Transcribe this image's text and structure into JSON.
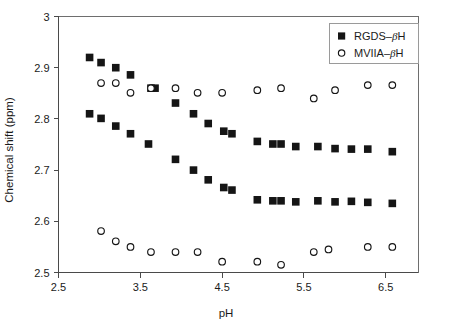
{
  "chart_data": {
    "type": "scatter",
    "title": "",
    "xlabel": "pH",
    "ylabel": "Chemical shift (ppm)",
    "xlim": [
      2.5,
      6.9
    ],
    "ylim": [
      2.5,
      3.0
    ],
    "xticks": [
      2.5,
      3.5,
      4.5,
      5.5,
      6.5
    ],
    "xtick_labels": [
      "2.5",
      "3.5",
      "4.5",
      "5.5",
      "6.5"
    ],
    "yticks": [
      2.5,
      2.6,
      2.7,
      2.8,
      2.9,
      3.0
    ],
    "ytick_labels": [
      "2.5",
      "2.6",
      "2.7",
      "2.8",
      "2.9",
      "3"
    ],
    "grid": false,
    "legend_position": "top-right",
    "legend": [
      "RGDS–βH",
      "MVIIA–βH"
    ],
    "series": [
      {
        "name": "RGDS–βH (upper)",
        "marker": "filled-square",
        "color": "#151515",
        "x": [
          2.88,
          3.02,
          3.2,
          3.38,
          3.63,
          3.68,
          3.93,
          4.15,
          4.33,
          4.52,
          4.62,
          4.93,
          5.12,
          5.22,
          5.4,
          5.67,
          5.88,
          6.08,
          6.28,
          6.58
        ],
        "y": [
          2.92,
          2.91,
          2.9,
          2.886,
          2.86,
          2.86,
          2.831,
          2.81,
          2.791,
          2.776,
          2.771,
          2.756,
          2.751,
          2.751,
          2.746,
          2.746,
          2.742,
          2.741,
          2.741,
          2.736
        ]
      },
      {
        "name": "RGDS–βH (lower)",
        "marker": "filled-square",
        "color": "#151515",
        "x": [
          2.88,
          3.02,
          3.2,
          3.38,
          3.6,
          3.93,
          4.15,
          4.33,
          4.52,
          4.62,
          4.93,
          5.12,
          5.22,
          5.4,
          5.67,
          5.88,
          6.08,
          6.28,
          6.58
        ],
        "y": [
          2.81,
          2.801,
          2.786,
          2.771,
          2.751,
          2.721,
          2.7,
          2.681,
          2.666,
          2.661,
          2.642,
          2.64,
          2.64,
          2.638,
          2.64,
          2.638,
          2.639,
          2.637,
          2.635
        ]
      },
      {
        "name": "MVIIA–βH (upper)",
        "marker": "open-circle",
        "color": "#151515",
        "x": [
          3.02,
          3.2,
          3.38,
          3.63,
          3.93,
          4.2,
          4.5,
          4.93,
          5.22,
          5.62,
          5.88,
          6.28,
          6.58
        ],
        "y": [
          2.87,
          2.87,
          2.851,
          2.86,
          2.86,
          2.851,
          2.851,
          2.856,
          2.86,
          2.84,
          2.856,
          2.866,
          2.866
        ]
      },
      {
        "name": "MVIIA–βH (lower)",
        "marker": "open-circle",
        "color": "#151515",
        "x": [
          3.02,
          3.2,
          3.38,
          3.63,
          3.93,
          4.2,
          4.5,
          4.93,
          5.22,
          5.62,
          5.8,
          6.28,
          6.58
        ],
        "y": [
          2.581,
          2.561,
          2.55,
          2.54,
          2.54,
          2.54,
          2.521,
          2.521,
          2.515,
          2.54,
          2.545,
          2.55,
          2.55
        ]
      }
    ]
  },
  "legend": {
    "entries": [
      {
        "label_main": "RGDS–",
        "label_greek": "β",
        "label_tail": "H",
        "marker": "filled-square"
      },
      {
        "label_main": "MVIIA–",
        "label_greek": "β",
        "label_tail": "H",
        "marker": "open-circle"
      }
    ]
  }
}
